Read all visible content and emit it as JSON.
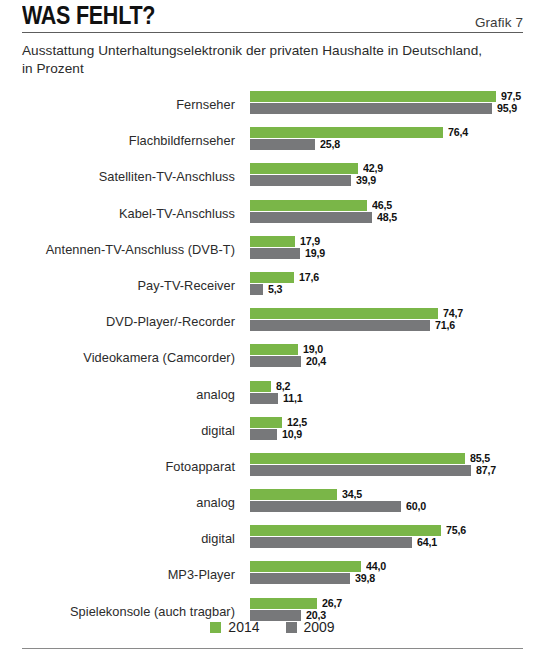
{
  "header": {
    "title": "WAS FEHLT?",
    "figure_label": "Grafik 7"
  },
  "subtitle": "Ausstattung Unterhaltungselektronik der privaten Haushalte in Deutschland, in Prozent",
  "legend": {
    "items": [
      {
        "label": "2014",
        "color": "#7ab648"
      },
      {
        "label": "2009",
        "color": "#77787a"
      }
    ]
  },
  "colors": {
    "series_2014": "#7ab648",
    "series_2009": "#77787a",
    "text": "#2b2b2b",
    "rule": "#5d5d5d"
  },
  "chart_data": {
    "type": "bar",
    "orientation": "horizontal",
    "title": "WAS FEHLT?",
    "subtitle": "Ausstattung Unterhaltungselektronik der privaten Haushalte in Deutschland, in Prozent",
    "xlabel": "Prozent",
    "ylabel": "",
    "xlim": [
      0,
      100
    ],
    "grid": false,
    "legend_position": "bottom",
    "categories": [
      "Fernseher",
      "Flachbildfernseher",
      "Satelliten-TV-Anschluss",
      "Kabel-TV-Anschluss",
      "Antennen-TV-Anschluss (DVB-T)",
      "Pay-TV-Receiver",
      "DVD-Player/-Recorder",
      "Videokamera (Camcorder)",
      "analog",
      "digital",
      "Fotoapparat",
      "analog",
      "digital",
      "MP3-Player",
      "Spielekonsole (auch tragbar)"
    ],
    "category_indent": [
      0,
      1,
      0,
      0,
      0,
      0,
      0,
      0,
      1,
      1,
      0,
      1,
      1,
      0,
      0
    ],
    "series": [
      {
        "name": "2014",
        "color": "#7ab648",
        "values": [
          97.5,
          76.4,
          42.9,
          46.5,
          17.9,
          17.6,
          74.7,
          19.0,
          8.2,
          12.5,
          85.5,
          34.5,
          75.6,
          44.0,
          26.7
        ],
        "labels": [
          "97,5",
          "76,4",
          "42,9",
          "46,5",
          "17,9",
          "17,6",
          "74,7",
          "19,0",
          "8,2",
          "12,5",
          "85,5",
          "34,5",
          "75,6",
          "44,0",
          "26,7"
        ]
      },
      {
        "name": "2009",
        "color": "#77787a",
        "values": [
          95.9,
          25.8,
          39.9,
          48.5,
          19.9,
          5.3,
          71.6,
          20.4,
          11.1,
          10.9,
          87.7,
          60.0,
          64.1,
          39.8,
          20.3
        ],
        "labels": [
          "95,9",
          "25,8",
          "39,9",
          "48,5",
          "19,9",
          "5,3",
          "71,6",
          "20,4",
          "11,1",
          "10,9",
          "87,7",
          "60,0",
          "64,1",
          "39,8",
          "20,3"
        ]
      }
    ]
  }
}
